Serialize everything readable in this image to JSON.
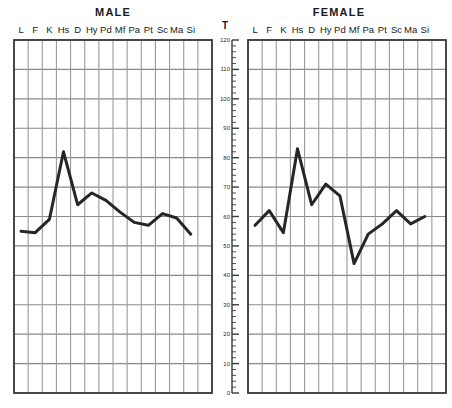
{
  "figure": {
    "panels": [
      {
        "id": "male",
        "title": "MALE"
      },
      {
        "id": "female",
        "title": "FEMALE"
      }
    ],
    "axis_title": "T",
    "colors": {
      "line": "#262626",
      "grid_major": "#8a8a8a",
      "grid_minor": "#9a9a9a",
      "frame": "#3a3a3a",
      "text": "#1a1a1a",
      "background": "#ffffff"
    }
  },
  "chart_data": [
    {
      "type": "line",
      "title": "MALE",
      "xlabel": "",
      "ylabel": "T",
      "categories": [
        "L",
        "F",
        "K",
        "Hs",
        "D",
        "Hy",
        "Pd",
        "Mf",
        "Pa",
        "Pt",
        "Sc",
        "Ma",
        "Si"
      ],
      "values": [
        55,
        54.5,
        59,
        82,
        64,
        68,
        65.5,
        61.5,
        58,
        57,
        61,
        59.5,
        54
      ],
      "ylim": [
        0,
        120
      ],
      "ytick_major": [
        0,
        10,
        20,
        30,
        40,
        50,
        60,
        70,
        80,
        90,
        100,
        110,
        120
      ],
      "ytick_minor_step": 2,
      "grid": true,
      "legend": "none"
    },
    {
      "type": "line",
      "title": "FEMALE",
      "xlabel": "",
      "ylabel": "T",
      "categories": [
        "L",
        "F",
        "K",
        "Hs",
        "D",
        "Hy",
        "Pd",
        "Mf",
        "Pa",
        "Pt",
        "Sc",
        "Ma",
        "Si"
      ],
      "values": [
        57,
        62,
        54.5,
        83,
        64,
        71,
        67,
        44,
        54,
        57.5,
        62,
        57.5,
        60
      ],
      "ylim": [
        0,
        120
      ],
      "ytick_major": [
        0,
        10,
        20,
        30,
        40,
        50,
        60,
        70,
        80,
        90,
        100,
        110,
        120
      ],
      "ytick_minor_step": 2,
      "grid": true,
      "legend": "none"
    }
  ],
  "axis": {
    "tick_labels": [
      "120",
      "110",
      "100",
      "90",
      "80",
      "70",
      "60",
      "50",
      "40",
      "30",
      "20",
      "10",
      "0"
    ]
  }
}
